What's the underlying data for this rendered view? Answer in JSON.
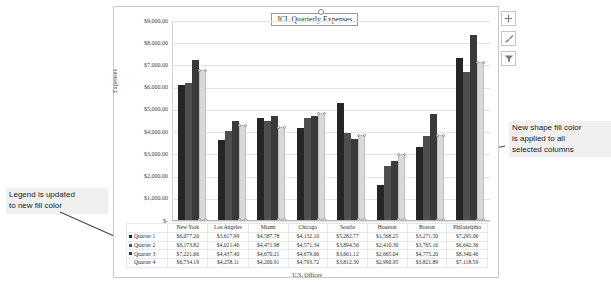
{
  "chart": {
    "title": "JCL Quarterly Expenses",
    "y_axis_title": "Expenses",
    "x_axis_title": "U.S. Offices",
    "y_ticks": [
      "$9,000.00",
      "$8,000.00",
      "$7,000.00",
      "$6,000.00",
      "$5,000.00",
      "$4,000.00",
      "$3,000.00",
      "$2,000.00",
      "$1,000.00",
      "$-"
    ]
  },
  "chart_data": {
    "type": "bar",
    "title": "JCL Quarterly Expenses",
    "xlabel": "U.S. Offices",
    "ylabel": "Expenses",
    "ylim": [
      0,
      9000
    ],
    "grid": true,
    "legend": "table",
    "categories": [
      "New York",
      "Los Angeles",
      "Miami",
      "Chicago",
      "Seattle",
      "Houston",
      "Boston",
      "Philadelphia"
    ],
    "series": [
      {
        "name": "Quarter 1",
        "color": "#262626",
        "values": [
          6077.2,
          3617.99,
          4587.78,
          4132.1,
          5282.77,
          1568.25,
          3271.5,
          7295.06
        ],
        "labels": [
          "$6,077.20",
          "$3,617.99",
          "$4,587.78",
          "$4,132.10",
          "$5,282.77",
          "$1,568.25",
          "$3,271.50",
          "$7,295.06"
        ]
      },
      {
        "name": "Quarter 2",
        "color": "#4f4f4f",
        "values": [
          6173.82,
          4021.46,
          4471.98,
          4571.34,
          3894.56,
          2410.3,
          3765.16,
          6642.36
        ],
        "labels": [
          "$6,173.82",
          "$4,021.46",
          "$4,471.98",
          "$4,571.34",
          "$3,894.56",
          "$2,410.30",
          "$3,765.16",
          "$6,642.36"
        ]
      },
      {
        "name": "Quarter 3",
        "color": "#3a3a3a",
        "values": [
          7221.66,
          4437.4,
          4670.21,
          4679.06,
          3661.12,
          2665.04,
          4775.2,
          8340.46
        ],
        "labels": [
          "$7,221.66",
          "$4,437.40",
          "$4,670.21",
          "$4,679.06",
          "$3,661.12",
          "$2,665.04",
          "$4,775.20",
          "$8,340.46"
        ]
      },
      {
        "name": "Quarter 4",
        "color": "#d9d9d9",
        "selected": true,
        "values": [
          6734.19,
          4258.11,
          4200.91,
          4793.72,
          3812.3,
          2990.95,
          3821.89,
          7118.59
        ],
        "labels": [
          "$6,734.19",
          "$4,258.11",
          "$4,200.91",
          "$4,793.72",
          "$3,812.30",
          "$2,990.95",
          "$3,821.89",
          "$7,118.59"
        ]
      }
    ]
  },
  "table": {
    "corner": "",
    "headers": [
      "New York",
      "Los Angeles",
      "Miami",
      "Chicago",
      "Seattle",
      "Houston",
      "Boston",
      "Philadelphia"
    ],
    "rows": [
      {
        "label": "Quarter 1",
        "values": [
          "$6,077.20",
          "$3,617.99",
          "$4,587.78",
          "$4,132.10",
          "$5,282.77",
          "$1,568.25",
          "$3,271.50",
          "$7,295.06"
        ]
      },
      {
        "label": "Quarter 2",
        "values": [
          "$6,173.82",
          "$4,021.46",
          "$4,471.98",
          "$4,571.34",
          "$3,894.56",
          "$2,410.30",
          "$3,765.16",
          "$6,642.36"
        ]
      },
      {
        "label": "Quarter 3",
        "values": [
          "$7,221.66",
          "$4,437.40",
          "$4,670.21",
          "$4,679.06",
          "$3,661.12",
          "$2,665.04",
          "$4,775.20",
          "$8,340.46"
        ]
      },
      {
        "label": "Quarter 4",
        "values": [
          "$6,734.19",
          "$4,258.11",
          "$4,200.91",
          "$4,793.72",
          "$3,812.30",
          "$2,990.95",
          "$3,821.89",
          "$7,118.59"
        ]
      }
    ]
  },
  "side_buttons": [
    {
      "name": "chart-elements",
      "icon": "plus-icon"
    },
    {
      "name": "chart-styles",
      "icon": "paintbrush-icon"
    },
    {
      "name": "chart-filters",
      "icon": "funnel-icon"
    }
  ],
  "annotations": {
    "left": "Legend is updated\nto new fill color",
    "right": "New shape fill color\nis applied to all\nselected columns"
  },
  "colors": {
    "quarter1": "#262626",
    "quarter2": "#4f4f4f",
    "quarter3": "#3a3a3a",
    "quarter4_new_fill": "#d9d9d9",
    "callout_bg": "#f0f0f0"
  }
}
